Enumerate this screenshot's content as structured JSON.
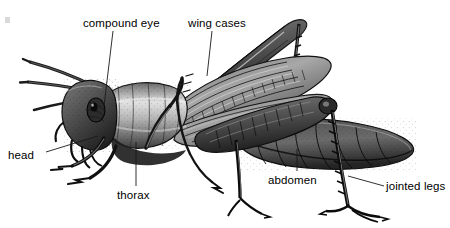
{
  "figure": {
    "style": "black-and-white engraved scientific illustration",
    "background_color": "#ffffff",
    "ink_color": "#1a1a1a",
    "label_color": "#000000"
  },
  "labels": {
    "compound_eye": "compound eye",
    "wing_cases": "wing cases",
    "head": "head",
    "thorax": "thorax",
    "abdomen": "abdomen",
    "jointed_legs": "jointed legs"
  },
  "leader_lines": [
    {
      "name": "compound-eye-leader",
      "from": [
        113,
        30
      ],
      "to": [
        104,
        106
      ]
    },
    {
      "name": "wing-cases-leader",
      "from": [
        212,
        30
      ],
      "to": [
        207,
        75
      ]
    },
    {
      "name": "head-leader",
      "from": [
        45,
        152
      ],
      "to": [
        96,
        136
      ]
    },
    {
      "name": "thorax-leader",
      "from": [
        136,
        186
      ],
      "to": [
        136,
        142
      ]
    },
    {
      "name": "abdomen-leader",
      "from": [
        297,
        171
      ],
      "to": [
        297,
        148
      ]
    },
    {
      "name": "jointed-legs-leader",
      "from": [
        384,
        185
      ],
      "to": [
        349,
        176
      ]
    }
  ]
}
